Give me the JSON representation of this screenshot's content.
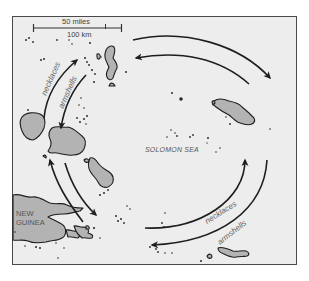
{
  "map": {
    "scale_bar": {
      "upper_label": "50 miles",
      "lower_label": "100 km"
    },
    "labels": {
      "sea": "SOLOMON SEA",
      "landmass_line1": "NEW",
      "landmass_line2": "GUINEA"
    },
    "routes": [
      {
        "name": "outer-ring",
        "direction": "clockwise",
        "goods_left": "necklaces",
        "goods_right": "necklaces"
      },
      {
        "name": "inner-ring",
        "direction": "counterclockwise",
        "goods_left": "armshells",
        "goods_right": "armshells"
      }
    ],
    "route_labels": {
      "left_outer": "necklaces",
      "left_inner": "armshells",
      "right_inner": "necklaces",
      "right_outer": "armshells"
    },
    "colors": {
      "sea": "#ededed",
      "land": "#b3b3b3",
      "outline": "#1e1e1e",
      "frame": "#4a4a4a"
    }
  }
}
